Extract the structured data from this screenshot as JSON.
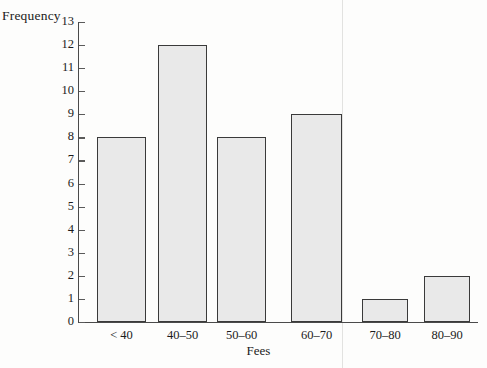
{
  "chart_data": {
    "type": "bar",
    "title": "",
    "xlabel": "Fees",
    "ylabel": "Frequency",
    "categories": [
      "< 40",
      "40–50",
      "50–60",
      "60–70",
      "70–80",
      "80–90"
    ],
    "values": [
      8,
      12,
      8,
      9,
      1,
      2
    ],
    "ylim": [
      0,
      13
    ],
    "ytick_labels": [
      "0",
      "1",
      "2",
      "3",
      "4",
      "5",
      "6",
      "7",
      "8",
      "9",
      "10",
      "11",
      "12",
      "13"
    ],
    "ytick_values": [
      0,
      1,
      2,
      3,
      4,
      5,
      6,
      7,
      8,
      9,
      10,
      11,
      12,
      13
    ],
    "grid": false,
    "legend": null,
    "colors": {
      "bar_fill": "#e9e9e9",
      "bar_edge": "#3a3a3a",
      "axis": "#4a4a4a",
      "text": "#1b1b1b",
      "background": "#fdfdfc"
    }
  }
}
